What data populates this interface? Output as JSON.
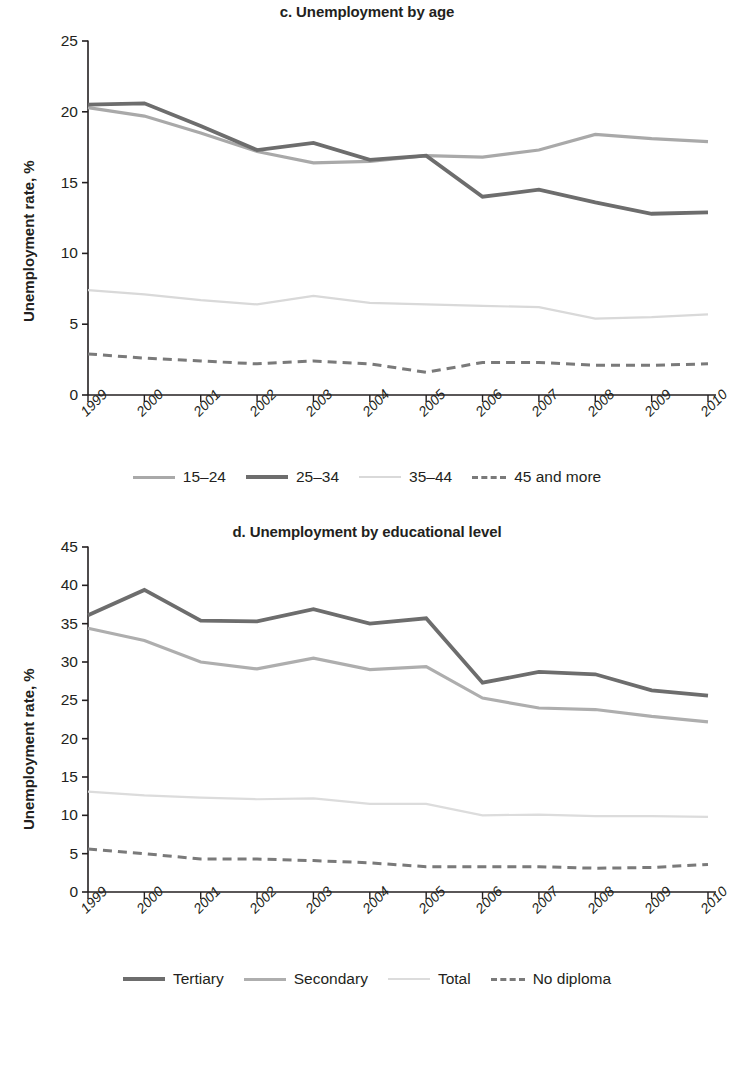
{
  "chart_data": [
    {
      "id": "chart-c",
      "type": "line",
      "title": "c. Unemployment by age",
      "xlabel": "",
      "ylabel": "Unemployment rate, %",
      "ylim": [
        0,
        25
      ],
      "yticks": [
        0,
        5,
        10,
        15,
        20,
        25
      ],
      "grid": false,
      "legend_position": "bottom",
      "categories": [
        "1999",
        "2000",
        "2001",
        "2002",
        "2003",
        "2004",
        "2005",
        "2006",
        "2007",
        "2008",
        "2009",
        "2010"
      ],
      "series": [
        {
          "name": "15–24",
          "color": "#a9a9a9",
          "style": "solid",
          "width": 3.2,
          "values": [
            20.3,
            19.7,
            18.5,
            17.2,
            16.4,
            16.5,
            16.9,
            16.8,
            17.3,
            18.4,
            18.1,
            17.9
          ]
        },
        {
          "name": "25–34",
          "color": "#6d6d6d",
          "style": "solid",
          "width": 3.8,
          "values": [
            20.5,
            20.6,
            19.0,
            17.3,
            17.8,
            16.6,
            16.9,
            14.0,
            14.5,
            13.6,
            12.8,
            12.9
          ]
        },
        {
          "name": "35–44",
          "color": "#d9d9d9",
          "style": "solid",
          "width": 2.2,
          "values": [
            7.4,
            7.1,
            6.7,
            6.4,
            7.0,
            6.5,
            6.4,
            6.3,
            6.2,
            5.4,
            5.5,
            5.7
          ]
        },
        {
          "name": "45 and more",
          "color": "#7a7a7a",
          "style": "dashed",
          "width": 3.0,
          "values": [
            2.9,
            2.6,
            2.4,
            2.2,
            2.4,
            2.2,
            1.6,
            2.3,
            2.3,
            2.1,
            2.1,
            2.2
          ]
        }
      ]
    },
    {
      "id": "chart-d",
      "type": "line",
      "title": "d. Unemployment by educational level",
      "xlabel": "",
      "ylabel": "Unemployment rate, %",
      "ylim": [
        0,
        45
      ],
      "yticks": [
        0,
        5,
        10,
        15,
        20,
        25,
        30,
        35,
        40,
        45
      ],
      "grid": false,
      "legend_position": "bottom",
      "categories": [
        "1999",
        "2000",
        "2001",
        "2002",
        "2003",
        "2004",
        "2005",
        "2006",
        "2007",
        "2008",
        "2009",
        "2010"
      ],
      "series": [
        {
          "name": "Tertiary",
          "color": "#6d6d6d",
          "style": "solid",
          "width": 3.8,
          "values": [
            36.1,
            39.4,
            35.4,
            35.3,
            36.9,
            35.0,
            35.7,
            27.3,
            28.7,
            28.4,
            26.3,
            25.6
          ]
        },
        {
          "name": "Secondary",
          "color": "#aeaeae",
          "style": "solid",
          "width": 3.2,
          "values": [
            34.4,
            32.8,
            30.0,
            29.1,
            30.5,
            29.0,
            29.4,
            25.3,
            24.0,
            23.8,
            22.9,
            22.2
          ]
        },
        {
          "name": "Total",
          "color": "#dcdcdc",
          "style": "solid",
          "width": 2.2,
          "values": [
            13.1,
            12.6,
            12.3,
            12.1,
            12.2,
            11.5,
            11.5,
            10.0,
            10.1,
            9.9,
            9.9,
            9.8
          ]
        },
        {
          "name": "No diploma",
          "color": "#7a7a7a",
          "style": "dashed",
          "width": 3.0,
          "values": [
            5.6,
            5.0,
            4.3,
            4.3,
            4.1,
            3.8,
            3.3,
            3.3,
            3.3,
            3.1,
            3.2,
            3.6
          ]
        }
      ]
    }
  ]
}
